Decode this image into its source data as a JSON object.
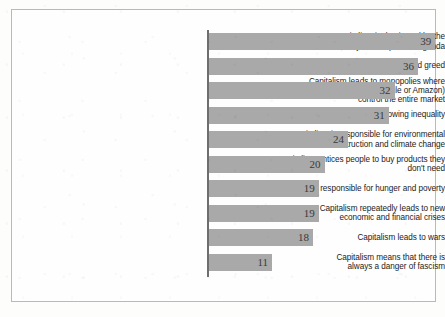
{
  "chart_data": {
    "type": "bar",
    "orientation": "horizontal",
    "title": "",
    "xlabel": "",
    "ylabel": "",
    "grid": false,
    "legend": null,
    "xlim": [
      0,
      39
    ],
    "categories": [
      "Capitalism is dominated by the\nrich, they set the political agenda",
      "Capitalism promotes selfishness and greed",
      "Capitalism leads to monopolies where\nindividual companies (e.g. Google or Amazon)\ncontrol the entire market",
      "Capitalism leads to growing inequality",
      "Capitalism is responsible for environmental\ndestruction and climate change",
      "Capitalism entices people to buy products they\ndon't need",
      "Capitalism is responsible for hunger and poverty",
      "Capitalism repeatedly leads to new\neconomic and financial crises",
      "Capitalism leads to wars",
      "Capitalism means that there is\nalways a danger of fascism"
    ],
    "values": [
      39,
      36,
      32,
      31,
      24,
      20,
      19,
      19,
      18,
      11
    ],
    "value_labels": [
      "39",
      "36",
      "32",
      "31",
      "24",
      "20",
      "19",
      "19",
      "18",
      "11"
    ],
    "bar_color": "#a9a9a9",
    "axis_color": "#6e6e6e",
    "label_color": "#1b1b1b",
    "value_color": "#3a3a3a"
  },
  "footer": {
    "note": ""
  }
}
